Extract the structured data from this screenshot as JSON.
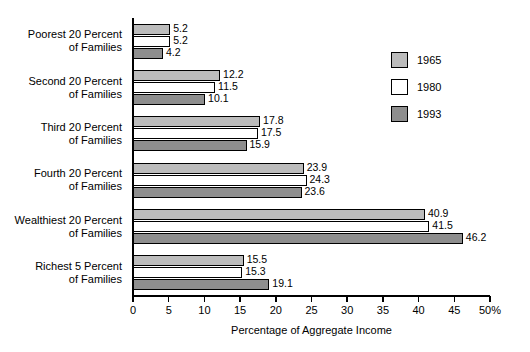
{
  "chart_data": {
    "type": "bar",
    "orientation": "horizontal",
    "title": "",
    "xlabel": "Percentage of Aggregate Income",
    "ylabel": "",
    "xlim": [
      0,
      50
    ],
    "xticks": [
      0,
      5,
      10,
      15,
      20,
      25,
      30,
      35,
      40,
      45,
      50
    ],
    "xtick_labels": [
      "0",
      "5",
      "10",
      "15",
      "20",
      "25",
      "30",
      "35",
      "40",
      "45",
      "50%"
    ],
    "grid": false,
    "legend_position": "upper right",
    "categories": [
      "Poorest 20 Percent of Families",
      "Second 20 Percent of Families",
      "Third 20 Percent of Families",
      "Fourth 20 Percent of Families",
      "Wealthiest 20 Percent of Families",
      "Richest 5 Percent of Families"
    ],
    "category_lines": [
      [
        "Poorest 20 Percent",
        "of Families"
      ],
      [
        "Second 20 Percent",
        "of Families"
      ],
      [
        "Third 20 Percent",
        "of Families"
      ],
      [
        "Fourth 20 Percent",
        "of Families"
      ],
      [
        "Wealthiest 20 Percent",
        "of Families"
      ],
      [
        "Richest 5 Percent",
        "of Families"
      ]
    ],
    "series": [
      {
        "name": "1965",
        "color": "#bcbcbc",
        "values": [
          5.2,
          12.2,
          17.8,
          23.9,
          40.9,
          15.5
        ],
        "labels": [
          "5.2",
          "12.2",
          "17.8",
          "23.9",
          "40.9",
          "15.5"
        ]
      },
      {
        "name": "1980",
        "color": "#ffffff",
        "values": [
          5.2,
          11.5,
          17.5,
          24.3,
          41.5,
          15.3
        ],
        "labels": [
          "5.2",
          "11.5",
          "17.5",
          "24.3",
          "41.5",
          "15.3"
        ]
      },
      {
        "name": "1993",
        "color": "#8e8e8e",
        "values": [
          4.2,
          10.1,
          15.9,
          23.6,
          46.2,
          19.1
        ],
        "labels": [
          "4.2",
          "10.1",
          "15.9",
          "23.6",
          "46.2",
          "19.1"
        ]
      }
    ]
  },
  "legend": {
    "entries": [
      {
        "label": "1965",
        "color": "#bcbcbc"
      },
      {
        "label": "1980",
        "color": "#ffffff"
      },
      {
        "label": "1993",
        "color": "#8e8e8e"
      }
    ]
  },
  "axis": {
    "x_title": "Percentage of Aggregate Income"
  }
}
